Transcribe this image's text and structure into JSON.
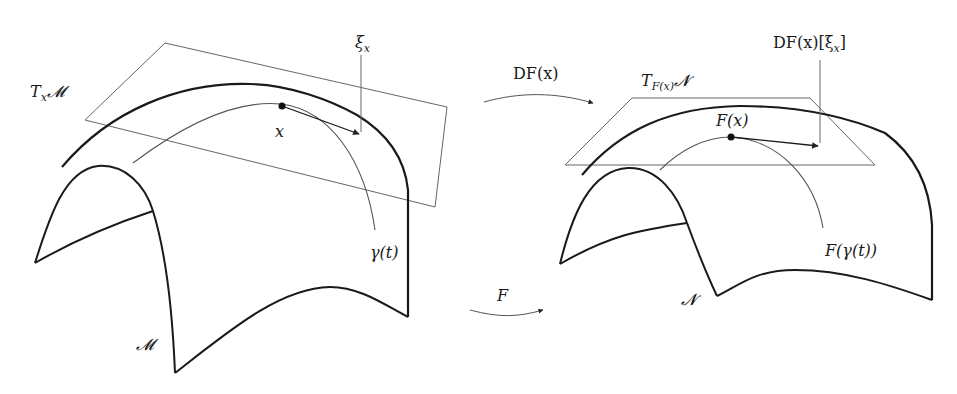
{
  "diagram": {
    "left": {
      "tangent_space_label": {
        "main": "T",
        "sub": "x",
        "manifold": "𝓜"
      },
      "vector_label": {
        "main": "ξ",
        "sub": "x"
      },
      "point_label": "x",
      "curve_label": "γ(t)",
      "manifold_label": "𝓜"
    },
    "right": {
      "tangent_space_label": {
        "main": "T",
        "sub": "F(x)",
        "manifold": "𝓝"
      },
      "vector_label": "DF(x)[ξ",
      "vector_label_sub": "x",
      "vector_label_close": "]",
      "point_label": "F(x)",
      "curve_label": "F(γ(t))",
      "manifold_label": "𝓝"
    },
    "maps": {
      "differential_label": "DF(x)",
      "map_label": "F"
    },
    "colors": {
      "surface_stroke": "#1a1a1a",
      "thin_stroke": "#555555",
      "background": "#ffffff"
    }
  }
}
